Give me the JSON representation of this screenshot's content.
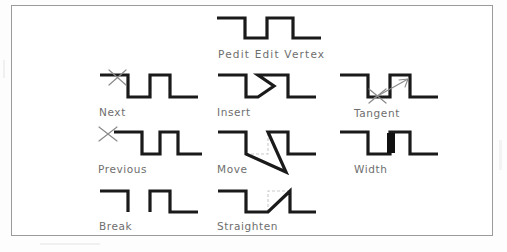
{
  "document": {
    "kind": "scanned-technical-diagram",
    "frame_border_color": "#9b9b9b",
    "background_color": "#ffffff",
    "line_color": "#1a1a1a",
    "label_color": "#6e6e6e",
    "marker_color": "#8a8a8a",
    "ghost_color": "#c9c9c9"
  },
  "title": {
    "label": "Pedit  Edit  Vertex",
    "glyph": "polyline-waveform"
  },
  "options": [
    {
      "id": "next",
      "label": "Next",
      "glyph": "waveform-with-x-marker-on-first-top-segment",
      "row": 1,
      "column": 1
    },
    {
      "id": "insert",
      "label": "Insert",
      "glyph": "waveform-with-inserted-vertex-arrowhead",
      "row": 1,
      "column": 2
    },
    {
      "id": "tangent",
      "label": "Tangent",
      "glyph": "waveform-with-x-marker-and-tangent-direction-arrow",
      "row": 1,
      "column": 3
    },
    {
      "id": "previous",
      "label": "Previous",
      "glyph": "waveform-with-x-marker-at-start-vertex",
      "row": 2,
      "column": 1
    },
    {
      "id": "move",
      "label": "Move",
      "glyph": "waveform-with-vertex-dragged-down-right-and-ghost-outline",
      "row": 2,
      "column": 2
    },
    {
      "id": "width",
      "label": "Width",
      "glyph": "waveform-with-thickened-segment",
      "row": 2,
      "column": 3
    },
    {
      "id": "break",
      "label": "Break",
      "glyph": "waveform-with-removed-bottom-segment-gap",
      "row": 3,
      "column": 1
    },
    {
      "id": "straighten",
      "label": "Straighten",
      "glyph": "waveform-with-peak-replaced-by-straight-diagonal-and-ghost",
      "row": 3,
      "column": 2
    }
  ]
}
